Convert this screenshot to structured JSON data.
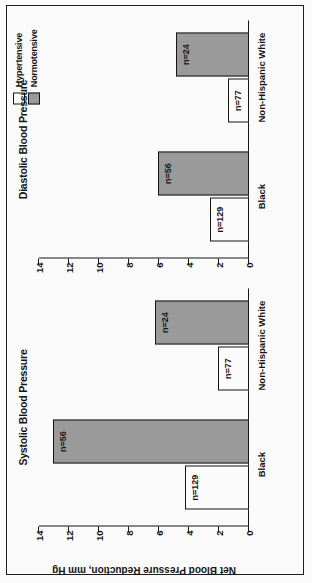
{
  "figure": {
    "orientation": "rotated-90-ccw",
    "background": "#ffffff",
    "frame_color": "#1a1a1a"
  },
  "legend": {
    "position": "top-right",
    "items": [
      {
        "label": "Hypertensive",
        "swatch": "white-square-icon",
        "fill": "#ffffff"
      },
      {
        "label": "Normotensive",
        "swatch": "gray-square-icon",
        "fill": "#9b9b9b"
      }
    ]
  },
  "axis": {
    "ylabel": "Net Blood Pressure Reduction, mm Hg",
    "ticks": [
      "0",
      "2",
      "4",
      "6",
      "8",
      "10",
      "12",
      "14"
    ],
    "ymin": 0,
    "ymax": 14
  },
  "panels": [
    {
      "id": "systolic",
      "title": "Systolic Blood Pressure",
      "categories": [
        "Black",
        "Non-Hispanic White"
      ],
      "bars": [
        {
          "category": "Black",
          "series": "Hypertensive",
          "value": 4.3,
          "label": "n=129"
        },
        {
          "category": "Black",
          "series": "Normotensive",
          "value": 13.1,
          "label": "n=56"
        },
        {
          "category": "Non-Hispanic White",
          "series": "Hypertensive",
          "value": 2.1,
          "label": "n=77"
        },
        {
          "category": "Non-Hispanic White",
          "series": "Normotensive",
          "value": 6.3,
          "label": "n=24"
        }
      ]
    },
    {
      "id": "diastolic",
      "title": "Diastolic Blood Pressure",
      "categories": [
        "Black",
        "Non-Hispanic White"
      ],
      "bars": [
        {
          "category": "Black",
          "series": "Hypertensive",
          "value": 2.6,
          "label": "n=129"
        },
        {
          "category": "Black",
          "series": "Normotensive",
          "value": 6.1,
          "label": "n=56"
        },
        {
          "category": "Non-Hispanic White",
          "series": "Hypertensive",
          "value": 1.4,
          "label": "n=77"
        },
        {
          "category": "Non-Hispanic White",
          "series": "Normotensive",
          "value": 4.9,
          "label": "n=24"
        }
      ]
    }
  ],
  "chart_data": {
    "type": "bar",
    "title": "",
    "subplots": [
      {
        "title": "Systolic Blood Pressure",
        "categories": [
          "Black",
          "Non-Hispanic White"
        ],
        "series": [
          {
            "name": "Hypertensive",
            "values": [
              4.3,
              2.1
            ],
            "point_labels": [
              "n=129",
              "n=77"
            ],
            "color": "#ffffff"
          },
          {
            "name": "Normotensive",
            "values": [
              13.1,
              6.3
            ],
            "point_labels": [
              "n=56",
              "n=24"
            ],
            "color": "#9b9b9b"
          }
        ],
        "xlabel": "",
        "ylabel": "Net Blood Pressure Reduction, mm Hg",
        "ylim": [
          0,
          14
        ],
        "yticks": [
          0,
          2,
          4,
          6,
          8,
          10,
          12,
          14
        ],
        "grid": false
      },
      {
        "title": "Diastolic Blood Pressure",
        "categories": [
          "Black",
          "Non-Hispanic White"
        ],
        "series": [
          {
            "name": "Hypertensive",
            "values": [
              2.6,
              1.4
            ],
            "point_labels": [
              "n=129",
              "n=77"
            ],
            "color": "#ffffff"
          },
          {
            "name": "Normotensive",
            "values": [
              6.1,
              4.9
            ],
            "point_labels": [
              "n=56",
              "n=24"
            ],
            "color": "#9b9b9b"
          }
        ],
        "xlabel": "",
        "ylabel": "Net Blood Pressure Reduction, mm Hg",
        "ylim": [
          0,
          14
        ],
        "yticks": [
          0,
          2,
          4,
          6,
          8,
          10,
          12,
          14
        ],
        "grid": false
      }
    ],
    "legend": {
      "position": "top-right",
      "entries": [
        "Hypertensive",
        "Normotensive"
      ]
    }
  }
}
